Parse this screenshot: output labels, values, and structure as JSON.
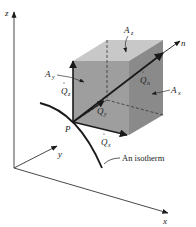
{
  "figure": {
    "axes": {
      "z": "z",
      "y": "y",
      "x": "x"
    },
    "point_label": "P",
    "vectors": {
      "qz": {
        "sym": "Q",
        "sub": "z"
      },
      "qy": {
        "sym": "Q",
        "sub": "y"
      },
      "qx": {
        "sym": "Q",
        "sub": "x"
      },
      "qn": {
        "sym": "Q",
        "sub": "n"
      }
    },
    "normal_label": "n",
    "areas": {
      "az": {
        "sym": "A",
        "sub": "z"
      },
      "ay": {
        "sym": "A",
        "sub": "y"
      },
      "ax": {
        "sym": "A",
        "sub": "x"
      }
    },
    "isotherm_label": "An isotherm",
    "colors": {
      "front_face": "#9e9e9e",
      "right_face": "#8a8a8a",
      "top_face": "#c8c8c8",
      "line": "#1a1a1a"
    }
  }
}
